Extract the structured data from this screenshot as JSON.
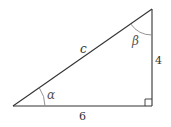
{
  "diagram": {
    "type": "right-triangle",
    "colors": {
      "stroke": "#333333",
      "arc": "#888888",
      "background": "#ffffff"
    },
    "vertices": {
      "bottom_left": [
        13,
        106
      ],
      "bottom_right": [
        152,
        106
      ],
      "top_right": [
        152,
        9
      ]
    },
    "labels": {
      "hypotenuse": "c",
      "vertical_side": "4",
      "horizontal_side": "6",
      "angle_bottom_left": "α",
      "angle_top": "β"
    },
    "right_angle_marker": "bottom_right"
  }
}
